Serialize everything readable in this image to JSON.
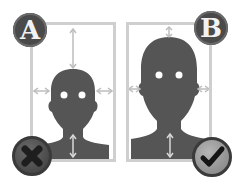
{
  "panels": [
    {
      "id": "A",
      "label": "A",
      "status": "rejected",
      "status_icon": "x-icon"
    },
    {
      "id": "B",
      "label": "B",
      "status": "accepted",
      "status_icon": "checkmark-icon"
    }
  ],
  "colors": {
    "silhouette": "#555555",
    "frame_border": "#cfcfcf",
    "badge_bg": "#4a4a4a",
    "badge_text": "#f2f2f2",
    "guide_arrow": "#bdbdbd",
    "reject_button": "#3c3c3c",
    "accept_button": "#9a9a9a"
  }
}
